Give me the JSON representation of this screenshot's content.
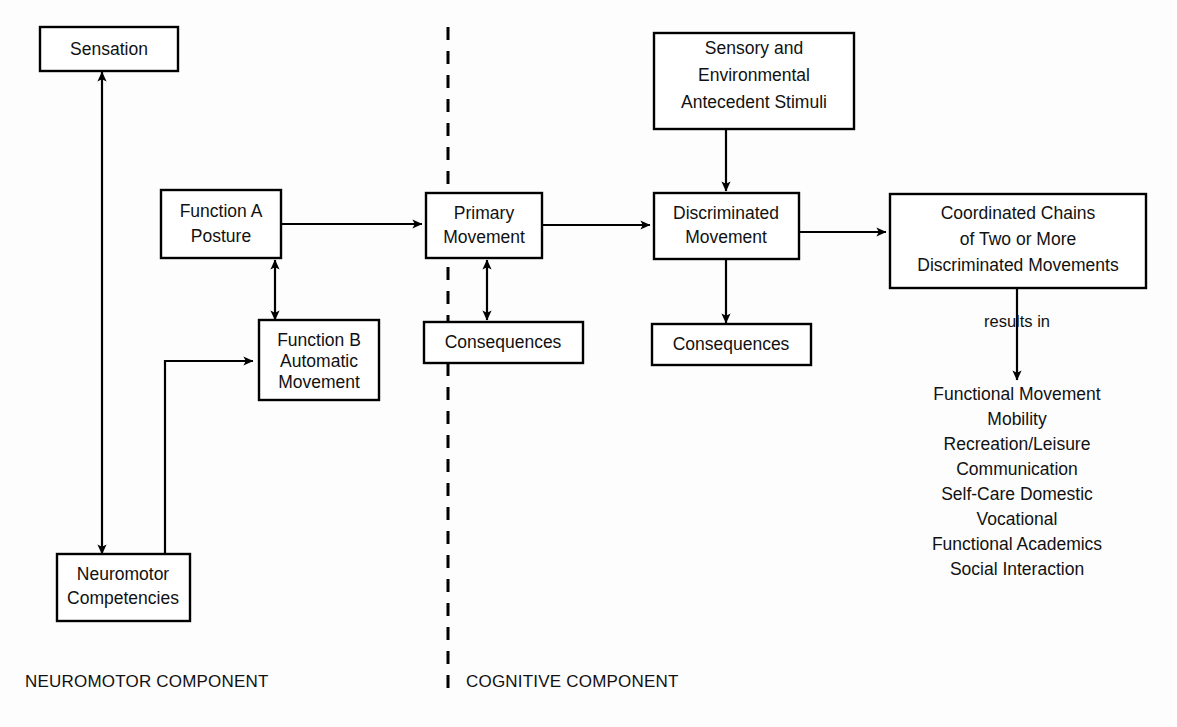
{
  "figure": {
    "stroke_color": "#000000",
    "background_color": "#ffffff"
  },
  "nodes": {
    "sensation": {
      "lines": [
        "Sensation"
      ]
    },
    "function_a": {
      "lines": [
        "Function A",
        "Posture"
      ]
    },
    "function_b": {
      "lines": [
        "Function B",
        "Automatic",
        "Movement"
      ]
    },
    "neuromotor_competencies": {
      "lines": [
        "Neuromotor",
        "Competencies"
      ]
    },
    "primary_movement": {
      "lines": [
        "Primary",
        "Movement"
      ]
    },
    "consequences_primary": {
      "lines": [
        "Consequences"
      ]
    },
    "sensory_antecedent": {
      "lines": [
        "Sensory and",
        "Environmental",
        "Antecedent Stimuli"
      ]
    },
    "discriminated_movement": {
      "lines": [
        "Discriminated",
        "Movement"
      ]
    },
    "consequences_discriminated": {
      "lines": [
        "Consequences"
      ]
    },
    "coordinated_chains": {
      "lines": [
        "Coordinated Chains",
        "of Two or More",
        "Discriminated Movements"
      ]
    }
  },
  "annotations": {
    "results_in": "results in"
  },
  "outcomes": {
    "items": [
      "Functional Movement",
      "Mobility",
      "Recreation/Leisure",
      "Communication",
      "Self-Care Domestic",
      "Vocational",
      "Functional Academics",
      "Social Interaction"
    ]
  },
  "captions": {
    "neuromotor_component": "NEUROMOTOR COMPONENT",
    "cognitive_component": "COGNITIVE COMPONENT"
  }
}
